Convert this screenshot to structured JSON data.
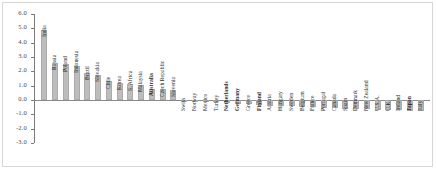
{
  "chart_data": {
    "type": "bar",
    "title": "",
    "subtitle": "",
    "xlabel": "",
    "ylabel": "",
    "ylim": [
      -3.0,
      6.0
    ],
    "ytick_labels": [
      "6.0",
      "5.0",
      "4.0",
      "3.0",
      "2.0",
      "1.0",
      "0.0",
      "-1.0",
      "-2.0",
      "-3.0"
    ],
    "ytick_values": [
      6.0,
      5.0,
      4.0,
      3.0,
      2.0,
      1.0,
      0.0,
      -1.0,
      -2.0,
      -3.0
    ],
    "grid": false,
    "legend": "none",
    "bar_color": "#bdbdbd",
    "axis_color": "#7b7b7b",
    "categories": [
      "India",
      "Russia",
      "Poland",
      "Indonesia",
      "Brazil",
      "Slovakia",
      "Chile",
      "Korea",
      "S. Africa",
      "Malaysia",
      "Australia",
      "Czech Republic",
      "Slovenia",
      "Swiss",
      "Norway",
      "Mexico",
      "Turkey",
      "Netherlands",
      "Germany",
      "Greece",
      "Finland",
      "Austria",
      "Hungary",
      "Sweden",
      "Belgium",
      "France",
      "Portugal",
      "Canada",
      "Spain",
      "Denmark",
      "New Zealand",
      "U.S.A.",
      "U.K.",
      "Ireland",
      "Japan",
      "Italy"
    ],
    "values": [
      4.9,
      2.6,
      2.5,
      2.4,
      1.9,
      1.75,
      1.3,
      1.2,
      1.15,
      1.05,
      0.8,
      0.75,
      0.7,
      -0.05,
      -0.08,
      -0.1,
      -0.15,
      -0.2,
      -0.25,
      -0.3,
      -0.35,
      -0.4,
      -0.42,
      -0.45,
      -0.5,
      -0.52,
      -0.55,
      -0.58,
      -0.6,
      -0.62,
      -0.65,
      -0.68,
      -0.7,
      -0.72,
      -0.75,
      -0.8
    ],
    "bold_labels": [
      "Australia",
      "Netherlands",
      "Germany",
      "Finland",
      "Japan"
    ]
  }
}
